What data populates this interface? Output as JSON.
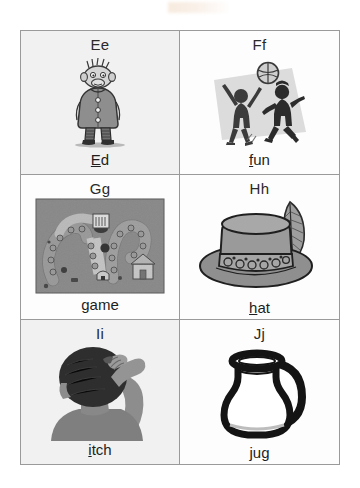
{
  "page": {
    "background_color": "#ffffff",
    "border_color": "#9a9a9a",
    "smudge": {
      "name": "scan-artifact",
      "color": "#e6be96"
    }
  },
  "grid": {
    "columns": 2,
    "rows": 3,
    "cells": [
      {
        "id": "cell-e",
        "letter": "Ee",
        "word": "Ed",
        "underlined_prefix": "E",
        "rest": "d",
        "picture": "ogre-character",
        "picture_alt": "Cartoon ogre character named Ed wearing a long coat and boots",
        "tint": true
      },
      {
        "id": "cell-f",
        "letter": "Ff",
        "word": "fun",
        "underlined_prefix": "f",
        "rest": "un",
        "picture": "children-playing-ball",
        "picture_alt": "Two children silhouettes jumping and playing with a ball",
        "tint": false
      },
      {
        "id": "cell-g",
        "letter": "Gg",
        "word": "game",
        "underlined_prefix": "g",
        "rest": "ame",
        "picture": "board-game",
        "picture_alt": "Photo of a winding board game path with tokens and a house",
        "tint": false
      },
      {
        "id": "cell-h",
        "letter": "Hh",
        "word": "hat",
        "underlined_prefix": "h",
        "rest": "at",
        "picture": "hat-with-feather",
        "picture_alt": "Grey hat with a patterned band and a feather",
        "tint": false
      },
      {
        "id": "cell-i",
        "letter": "Ii",
        "word": "itch",
        "underlined_prefix": "i",
        "rest": "tch",
        "picture": "person-scratching-head",
        "picture_alt": "Silhouette of a person scratching the back of their head",
        "tint": true
      },
      {
        "id": "cell-j",
        "letter": "Jj",
        "word": "jug",
        "underlined_prefix": "",
        "rest": "jug",
        "picture": "jug",
        "picture_alt": "Black outline drawing of a jug with a handle",
        "tint": false
      }
    ]
  },
  "colors": {
    "ink": "#1e1e1e",
    "letter_ink": "#2a2a2a",
    "rule": "#9a9a9a",
    "tint": "#f1f1f1",
    "silhouette": "#7d7d7d",
    "silhouette_dark": "#2e2e2e",
    "art_grey": "#8c8c8c",
    "art_grey_dark": "#5a5a5a",
    "art_grey_light": "#c9c9c9",
    "outline_black": "#141414"
  }
}
